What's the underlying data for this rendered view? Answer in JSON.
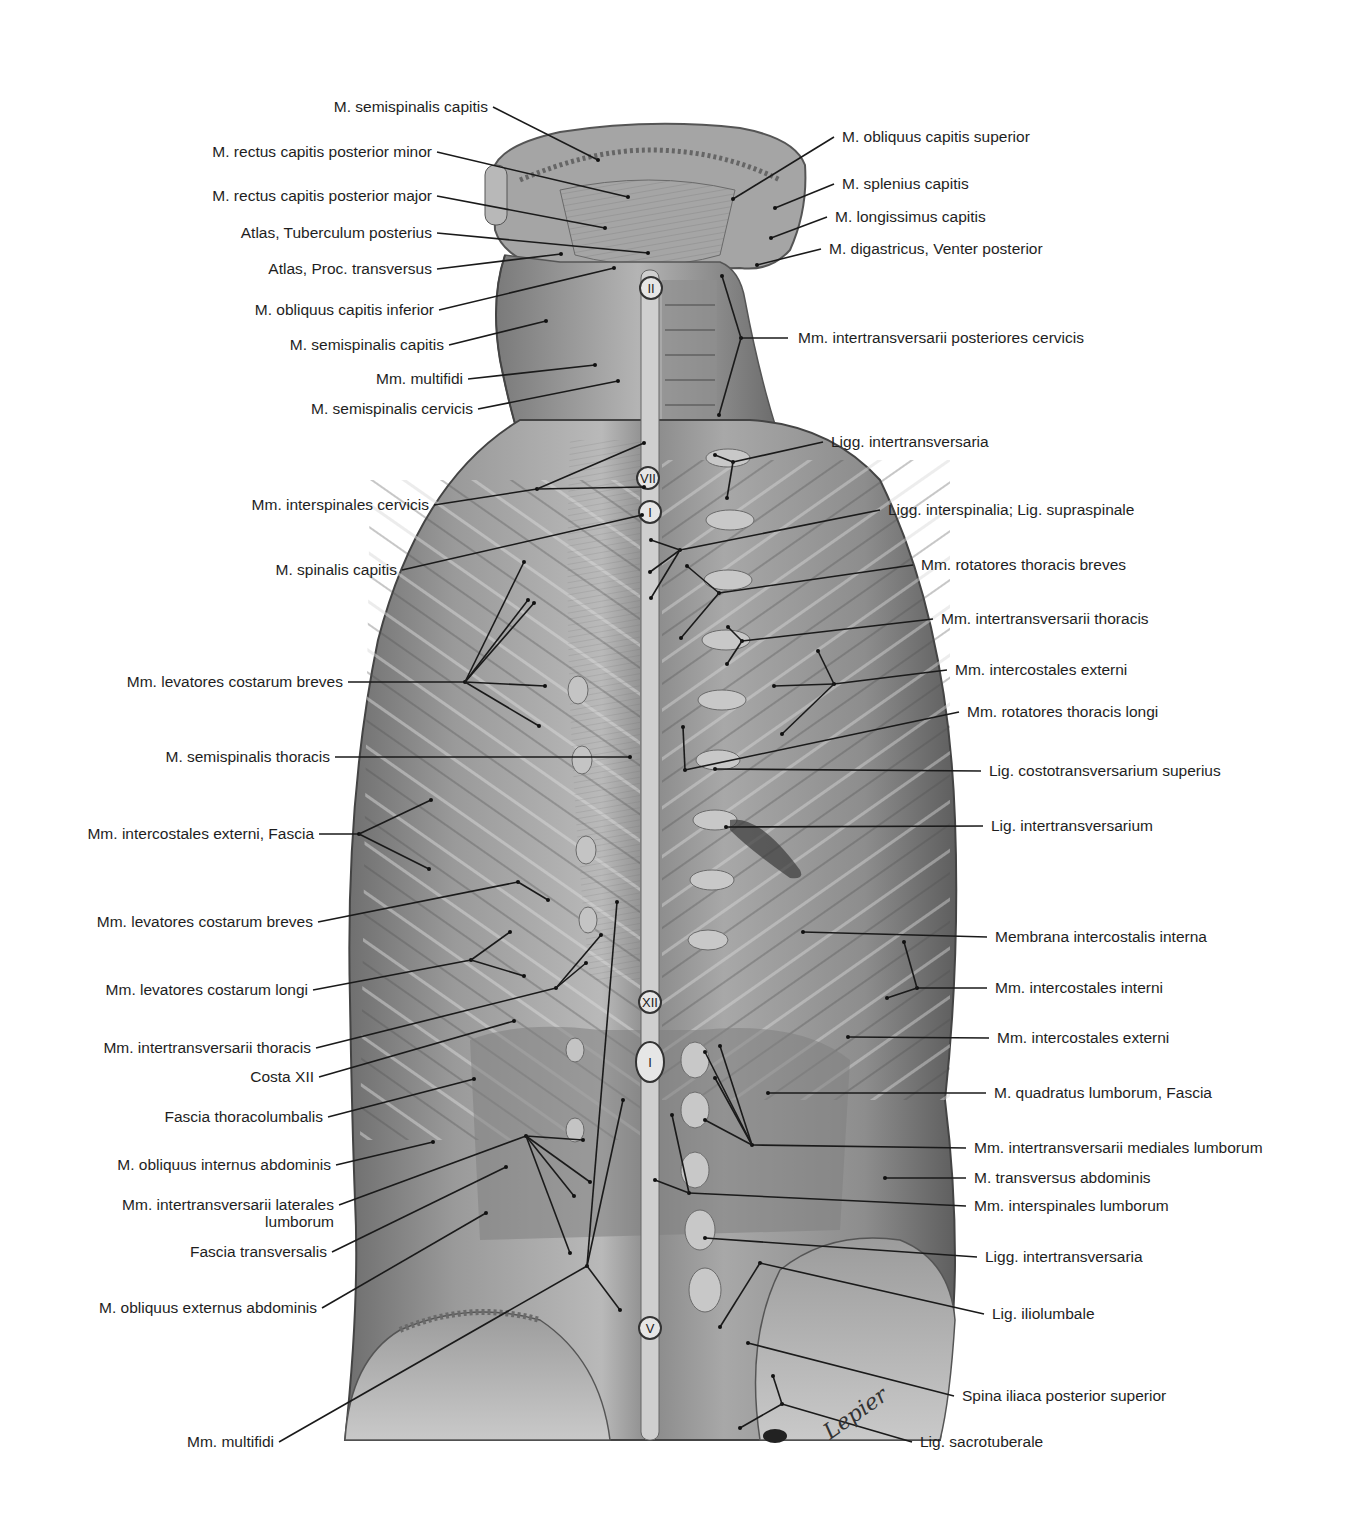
{
  "figure": {
    "artist_signature": "Lepier",
    "vertebra_markers": [
      {
        "id": "C2",
        "text": "II",
        "x": 651,
        "y": 288
      },
      {
        "id": "C7",
        "text": "VII",
        "x": 648,
        "y": 478
      },
      {
        "id": "T1",
        "text": "I",
        "x": 650,
        "y": 512
      },
      {
        "id": "T12",
        "text": "XII",
        "x": 650,
        "y": 1002
      },
      {
        "id": "L1",
        "text": "I",
        "x": 650,
        "y": 1062
      },
      {
        "id": "L5",
        "text": "V",
        "x": 650,
        "y": 1328
      }
    ]
  },
  "labels_left": [
    {
      "text": "M. semispinalis capitis",
      "x": 488,
      "y": 107,
      "lines": [
        [
          493,
          107,
          598,
          160
        ]
      ]
    },
    {
      "text": "M. rectus capitis posterior minor",
      "x": 432,
      "y": 152,
      "lines": [
        [
          437,
          152,
          628,
          197
        ]
      ]
    },
    {
      "text": "M. rectus capitis posterior major",
      "x": 432,
      "y": 196,
      "lines": [
        [
          437,
          196,
          605,
          228
        ]
      ]
    },
    {
      "text": "Atlas, Tuberculum posterius",
      "x": 432,
      "y": 233,
      "lines": [
        [
          437,
          233,
          648,
          253
        ]
      ]
    },
    {
      "text": "Atlas, Proc. transversus",
      "x": 432,
      "y": 269,
      "lines": [
        [
          437,
          269,
          561,
          254
        ]
      ]
    },
    {
      "text": "M. obliquus capitis inferior",
      "x": 434,
      "y": 310,
      "lines": [
        [
          439,
          310,
          614,
          268
        ]
      ]
    },
    {
      "text": "M. semispinalis capitis",
      "x": 444,
      "y": 345,
      "lines": [
        [
          449,
          345,
          546,
          321
        ]
      ]
    },
    {
      "text": "Mm. multifidi",
      "x": 463,
      "y": 379,
      "lines": [
        [
          468,
          379,
          595,
          365
        ]
      ]
    },
    {
      "text": "M. semispinalis cervicis",
      "x": 473,
      "y": 409,
      "lines": [
        [
          478,
          409,
          618,
          381
        ]
      ]
    },
    {
      "text": "Mm. interspinales cervicis",
      "x": 429,
      "y": 505,
      "lines": [
        [
          434,
          505,
          537,
          489
        ],
        [
          537,
          489,
          644,
          487
        ],
        [
          537,
          489,
          644,
          443
        ]
      ]
    },
    {
      "text": "M. spinalis capitis",
      "x": 397,
      "y": 570,
      "lines": [
        [
          402,
          570,
          642,
          515
        ]
      ]
    },
    {
      "text": "Mm. levatores costarum breves",
      "x": 343,
      "y": 682,
      "lines": [
        [
          348,
          682,
          465,
          682
        ],
        [
          465,
          682,
          524,
          562
        ],
        [
          465,
          682,
          534,
          603
        ],
        [
          465,
          682,
          545,
          686
        ],
        [
          465,
          682,
          539,
          726
        ],
        [
          465,
          682,
          528,
          600
        ]
      ]
    },
    {
      "text": "M. semispinalis thoracis",
      "x": 330,
      "y": 757,
      "lines": [
        [
          335,
          757,
          630,
          757
        ]
      ]
    },
    {
      "text": "Mm. intercostales externi, Fascia",
      "x": 314,
      "y": 834,
      "lines": [
        [
          319,
          834,
          359,
          834
        ],
        [
          359,
          834,
          431,
          800
        ],
        [
          359,
          834,
          429,
          869
        ]
      ]
    },
    {
      "text": "Mm. levatores costarum breves",
      "x": 313,
      "y": 922,
      "lines": [
        [
          318,
          922,
          518,
          882
        ],
        [
          518,
          882,
          548,
          900
        ]
      ]
    },
    {
      "text": "Mm. levatores costarum longi",
      "x": 308,
      "y": 990,
      "lines": [
        [
          313,
          990,
          471,
          960
        ],
        [
          471,
          960,
          510,
          932
        ],
        [
          471,
          960,
          524,
          976
        ]
      ]
    },
    {
      "text": "Mm. intertransversarii thoracis",
      "x": 311,
      "y": 1048,
      "lines": [
        [
          316,
          1048,
          556,
          988
        ],
        [
          556,
          988,
          586,
          963
        ],
        [
          556,
          988,
          601,
          935
        ]
      ]
    },
    {
      "text": "Costa XII",
      "x": 314,
      "y": 1077,
      "lines": [
        [
          319,
          1077,
          514,
          1021
        ]
      ]
    },
    {
      "text": "Fascia thoracolumbalis",
      "x": 323,
      "y": 1117,
      "lines": [
        [
          328,
          1117,
          474,
          1079
        ]
      ]
    },
    {
      "text": "M. obliquus internus abdominis",
      "x": 331,
      "y": 1165,
      "lines": [
        [
          336,
          1165,
          433,
          1142
        ]
      ]
    },
    {
      "text": "Mm. intertransversarii laterales\nlumborum",
      "x": 334,
      "y": 1205,
      "multi": true,
      "lines": [
        [
          339,
          1205,
          526,
          1136
        ],
        [
          526,
          1136,
          583,
          1140
        ],
        [
          526,
          1136,
          574,
          1196
        ],
        [
          526,
          1136,
          570,
          1253
        ],
        [
          526,
          1136,
          590,
          1182
        ]
      ]
    },
    {
      "text": "Fascia transversalis",
      "x": 327,
      "y": 1252,
      "lines": [
        [
          332,
          1252,
          506,
          1167
        ]
      ]
    },
    {
      "text": "M. obliquus externus abdominis",
      "x": 317,
      "y": 1308,
      "lines": [
        [
          322,
          1308,
          486,
          1213
        ]
      ]
    },
    {
      "text": "Mm. multifidi",
      "x": 274,
      "y": 1442,
      "lines": [
        [
          279,
          1442,
          587,
          1266
        ],
        [
          587,
          1266,
          620,
          1310
        ],
        [
          587,
          1266,
          617,
          902
        ],
        [
          587,
          1266,
          623,
          1100
        ]
      ]
    }
  ],
  "labels_right": [
    {
      "text": "M. obliquus capitis superior",
      "x": 842,
      "y": 137,
      "lines": [
        [
          834,
          137,
          733,
          199
        ]
      ]
    },
    {
      "text": "M. splenius capitis",
      "x": 842,
      "y": 184,
      "lines": [
        [
          834,
          184,
          775,
          208
        ]
      ]
    },
    {
      "text": "M. longissimus capitis",
      "x": 835,
      "y": 217,
      "lines": [
        [
          827,
          217,
          771,
          238
        ]
      ]
    },
    {
      "text": "M. digastricus, Venter posterior",
      "x": 829,
      "y": 249,
      "lines": [
        [
          821,
          249,
          757,
          265
        ]
      ]
    },
    {
      "text": "Mm. intertransversarii posteriores cervicis",
      "x": 798,
      "y": 338,
      "lines": [
        [
          788,
          338,
          741,
          338
        ],
        [
          741,
          338,
          722,
          276
        ],
        [
          741,
          338,
          719,
          415
        ]
      ]
    },
    {
      "text": "Ligg. intertransversaria",
      "x": 831,
      "y": 442,
      "lines": [
        [
          823,
          442,
          733,
          462
        ],
        [
          733,
          462,
          715,
          455
        ],
        [
          733,
          462,
          727,
          498
        ]
      ]
    },
    {
      "text": "Ligg. interspinalia; Lig. supraspinale",
      "x": 888,
      "y": 510,
      "lines": [
        [
          880,
          510,
          680,
          550
        ],
        [
          680,
          550,
          651,
          540
        ],
        [
          680,
          550,
          651,
          598
        ],
        [
          680,
          550,
          650,
          572
        ]
      ]
    },
    {
      "text": "Mm. rotatores thoracis breves",
      "x": 921,
      "y": 565,
      "lines": [
        [
          913,
          565,
          719,
          593
        ],
        [
          719,
          593,
          687,
          566
        ],
        [
          719,
          593,
          681,
          638
        ]
      ]
    },
    {
      "text": "Mm. intertransversarii thoracis",
      "x": 941,
      "y": 619,
      "lines": [
        [
          933,
          619,
          742,
          641
        ],
        [
          742,
          641,
          728,
          627
        ],
        [
          742,
          641,
          727,
          664
        ]
      ]
    },
    {
      "text": "Mm. intercostales externi",
      "x": 955,
      "y": 670,
      "lines": [
        [
          947,
          670,
          834,
          684
        ],
        [
          834,
          684,
          818,
          651
        ],
        [
          834,
          684,
          774,
          686
        ],
        [
          834,
          684,
          782,
          734
        ]
      ]
    },
    {
      "text": "Mm. rotatores thoracis longi",
      "x": 967,
      "y": 712,
      "lines": [
        [
          959,
          712,
          685,
          770
        ],
        [
          685,
          770,
          683,
          727
        ]
      ]
    },
    {
      "text": "Lig. costotransversarium superius",
      "x": 989,
      "y": 771,
      "lines": [
        [
          981,
          771,
          715,
          769
        ]
      ]
    },
    {
      "text": "Lig. intertransversarium",
      "x": 991,
      "y": 826,
      "lines": [
        [
          983,
          826,
          726,
          827
        ]
      ]
    },
    {
      "text": "Membrana intercostalis interna",
      "x": 995,
      "y": 937,
      "lines": [
        [
          987,
          937,
          803,
          932
        ]
      ]
    },
    {
      "text": "Mm. intercostales interni",
      "x": 995,
      "y": 988,
      "lines": [
        [
          987,
          988,
          917,
          988
        ],
        [
          917,
          988,
          904,
          942
        ],
        [
          917,
          988,
          887,
          998
        ]
      ]
    },
    {
      "text": "Mm. intercostales externi",
      "x": 997,
      "y": 1038,
      "lines": [
        [
          989,
          1038,
          848,
          1037
        ]
      ]
    },
    {
      "text": "M. quadratus lumborum, Fascia",
      "x": 994,
      "y": 1093,
      "lines": [
        [
          986,
          1093,
          768,
          1093
        ]
      ]
    },
    {
      "text": "Mm. intertransversarii mediales lumborum",
      "x": 974,
      "y": 1148,
      "lines": [
        [
          966,
          1148,
          752,
          1145
        ],
        [
          752,
          1145,
          705,
          1052
        ],
        [
          752,
          1145,
          715,
          1078
        ],
        [
          752,
          1145,
          705,
          1120
        ],
        [
          752,
          1145,
          720,
          1046
        ]
      ]
    },
    {
      "text": "M. transversus abdominis",
      "x": 974,
      "y": 1178,
      "lines": [
        [
          966,
          1178,
          885,
          1178
        ]
      ]
    },
    {
      "text": "Mm. interspinales lumborum",
      "x": 974,
      "y": 1206,
      "lines": [
        [
          966,
          1206,
          689,
          1193
        ],
        [
          689,
          1193,
          655,
          1180
        ],
        [
          689,
          1193,
          672,
          1115
        ]
      ]
    },
    {
      "text": "Ligg. intertransversaria",
      "x": 985,
      "y": 1257,
      "lines": [
        [
          977,
          1257,
          705,
          1238
        ]
      ]
    },
    {
      "text": "Lig. iliolumbale",
      "x": 992,
      "y": 1314,
      "lines": [
        [
          984,
          1314,
          760,
          1263
        ],
        [
          760,
          1263,
          720,
          1327
        ]
      ]
    },
    {
      "text": "Spina iliaca posterior superior",
      "x": 962,
      "y": 1396,
      "lines": [
        [
          954,
          1396,
          748,
          1343
        ]
      ]
    },
    {
      "text": "Lig. sacrotuberale",
      "x": 920,
      "y": 1442,
      "lines": [
        [
          912,
          1442,
          782,
          1404
        ],
        [
          782,
          1404,
          773,
          1376
        ],
        [
          782,
          1404,
          740,
          1428
        ]
      ]
    }
  ]
}
